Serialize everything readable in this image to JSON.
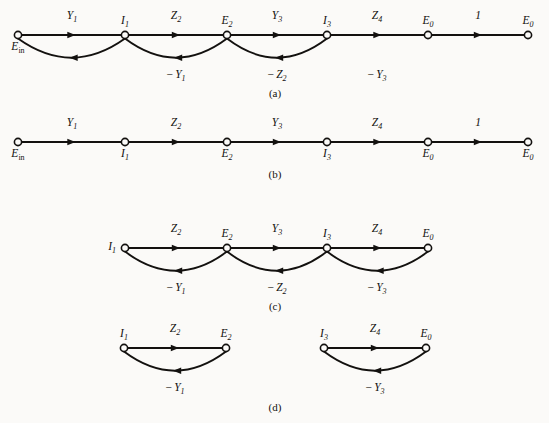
{
  "figure": {
    "width": 549,
    "height": 423,
    "ink_color": "#13110f",
    "paper_color": "#fbfaf8"
  },
  "panels": [
    {
      "id": "panel-a",
      "caption": "(a)",
      "caption_x": 275,
      "caption_y": 97,
      "baseline_y": 35,
      "nodes": [
        {
          "id": "n-a-ein",
          "label": "E",
          "sub": "in",
          "sub_style": "upright",
          "x": 18,
          "y": 35,
          "label_pos": "below"
        },
        {
          "id": "n-a-i1",
          "label": "I",
          "sub": "1",
          "sub_style": "italic",
          "x": 125,
          "y": 35,
          "label_pos": "above"
        },
        {
          "id": "n-a-e2",
          "label": "E",
          "sub": "2",
          "sub_style": "italic",
          "x": 227,
          "y": 35,
          "label_pos": "above"
        },
        {
          "id": "n-a-i3",
          "label": "I",
          "sub": "3",
          "sub_style": "italic",
          "x": 327,
          "y": 35,
          "label_pos": "above"
        },
        {
          "id": "n-a-e0",
          "label": "E",
          "sub": "0",
          "sub_style": "italic",
          "x": 428,
          "y": 35,
          "label_pos": "above"
        },
        {
          "id": "n-a-e0b",
          "label": "E",
          "sub": "0",
          "sub_style": "italic",
          "x": 528,
          "y": 35,
          "label_pos": "above"
        }
      ],
      "forward_edges": [
        {
          "id": "e-a-1",
          "from": 0,
          "to": 1,
          "label": "Y",
          "sub": "1",
          "sign": "",
          "label_x": 72,
          "label_y": 19
        },
        {
          "id": "e-a-2",
          "from": 1,
          "to": 2,
          "label": "Z",
          "sub": "2",
          "sign": "",
          "label_x": 176,
          "label_y": 19
        },
        {
          "id": "e-a-3",
          "from": 2,
          "to": 3,
          "label": "Y",
          "sub": "3",
          "sign": "",
          "label_x": 277,
          "label_y": 19
        },
        {
          "id": "e-a-4",
          "from": 3,
          "to": 4,
          "label": "Z",
          "sub": "4",
          "sign": "",
          "label_x": 377,
          "label_y": 19
        },
        {
          "id": "e-a-5",
          "from": 4,
          "to": 5,
          "label": "1",
          "sub": "",
          "sign": "",
          "label_x": 478,
          "label_y": 19
        }
      ],
      "feedback_edges": [
        {
          "id": "f-a-1",
          "from": 1,
          "to": 0,
          "label": "Y",
          "sub": "1",
          "sign": "−",
          "label_x": 176,
          "label_y": 78,
          "dip": 27
        },
        {
          "id": "f-a-2",
          "from": 2,
          "to": 1,
          "label": "Z",
          "sub": "2",
          "sign": "−",
          "label_x": 277,
          "label_y": 78,
          "dip": 27
        },
        {
          "id": "f-a-3",
          "from": 3,
          "to": 2,
          "label": "Y",
          "sub": "3",
          "sign": "−",
          "label_x": 377,
          "label_y": 78,
          "dip": 27
        }
      ]
    },
    {
      "id": "panel-b",
      "caption": "(b)",
      "caption_x": 275,
      "caption_y": 178,
      "baseline_y": 142,
      "nodes": [
        {
          "id": "n-b-ein",
          "label": "E",
          "sub": "in",
          "sub_style": "upright",
          "x": 18,
          "y": 142,
          "label_pos": "below"
        },
        {
          "id": "n-b-i1",
          "label": "I",
          "sub": "1",
          "sub_style": "italic",
          "x": 125,
          "y": 142,
          "label_pos": "below"
        },
        {
          "id": "n-b-e2",
          "label": "E",
          "sub": "2",
          "sub_style": "italic",
          "x": 227,
          "y": 142,
          "label_pos": "below"
        },
        {
          "id": "n-b-i3",
          "label": "I",
          "sub": "3",
          "sub_style": "italic",
          "x": 327,
          "y": 142,
          "label_pos": "below"
        },
        {
          "id": "n-b-e0",
          "label": "E",
          "sub": "0",
          "sub_style": "italic",
          "x": 428,
          "y": 142,
          "label_pos": "below"
        },
        {
          "id": "n-b-e0b",
          "label": "E",
          "sub": "0",
          "sub_style": "italic",
          "x": 528,
          "y": 142,
          "label_pos": "below"
        }
      ],
      "forward_edges": [
        {
          "id": "e-b-1",
          "from": 0,
          "to": 1,
          "label": "Y",
          "sub": "1",
          "sign": "",
          "label_x": 72,
          "label_y": 126
        },
        {
          "id": "e-b-2",
          "from": 1,
          "to": 2,
          "label": "Z",
          "sub": "2",
          "sign": "",
          "label_x": 176,
          "label_y": 126
        },
        {
          "id": "e-b-3",
          "from": 2,
          "to": 3,
          "label": "Y",
          "sub": "3",
          "sign": "",
          "label_x": 277,
          "label_y": 126
        },
        {
          "id": "e-b-4",
          "from": 3,
          "to": 4,
          "label": "Z",
          "sub": "4",
          "sign": "",
          "label_x": 377,
          "label_y": 126
        },
        {
          "id": "e-b-5",
          "from": 4,
          "to": 5,
          "label": "1",
          "sub": "",
          "sign": "",
          "label_x": 478,
          "label_y": 126
        }
      ],
      "feedback_edges": []
    },
    {
      "id": "panel-c",
      "caption": "(c)",
      "caption_x": 275,
      "caption_y": 310,
      "baseline_y": 248,
      "nodes": [
        {
          "id": "n-c-i1",
          "label": "I",
          "sub": "1",
          "sub_style": "italic",
          "x": 125,
          "y": 248,
          "label_pos": "left"
        },
        {
          "id": "n-c-e2",
          "label": "E",
          "sub": "2",
          "sub_style": "italic",
          "x": 227,
          "y": 248,
          "label_pos": "above"
        },
        {
          "id": "n-c-i3",
          "label": "I",
          "sub": "3",
          "sub_style": "italic",
          "x": 327,
          "y": 248,
          "label_pos": "above"
        },
        {
          "id": "n-c-e0",
          "label": "E",
          "sub": "0",
          "sub_style": "italic",
          "x": 428,
          "y": 248,
          "label_pos": "above"
        }
      ],
      "forward_edges": [
        {
          "id": "e-c-1",
          "from": 0,
          "to": 1,
          "label": "Z",
          "sub": "2",
          "sign": "",
          "label_x": 176,
          "label_y": 232
        },
        {
          "id": "e-c-2",
          "from": 1,
          "to": 2,
          "label": "Y",
          "sub": "3",
          "sign": "",
          "label_x": 277,
          "label_y": 232
        },
        {
          "id": "e-c-3",
          "from": 2,
          "to": 3,
          "label": "Z",
          "sub": "4",
          "sign": "",
          "label_x": 377,
          "label_y": 232
        }
      ],
      "feedback_edges": [
        {
          "id": "f-c-1",
          "from": 1,
          "to": 0,
          "label": "Y",
          "sub": "1",
          "sign": "−",
          "label_x": 176,
          "label_y": 291,
          "dip": 27
        },
        {
          "id": "f-c-2",
          "from": 2,
          "to": 1,
          "label": "Z",
          "sub": "2",
          "sign": "−",
          "label_x": 277,
          "label_y": 291,
          "dip": 27
        },
        {
          "id": "f-c-3",
          "from": 3,
          "to": 2,
          "label": "Y",
          "sub": "3",
          "sign": "−",
          "label_x": 377,
          "label_y": 291,
          "dip": 27
        }
      ]
    },
    {
      "id": "panel-d",
      "caption": "(d)",
      "caption_x": 275,
      "caption_y": 411,
      "baseline_y": 348,
      "nodes": [
        {
          "id": "n-d-i1",
          "label": "I",
          "sub": "1",
          "sub_style": "italic",
          "x": 124,
          "y": 348,
          "label_pos": "above"
        },
        {
          "id": "n-d-e2",
          "label": "E",
          "sub": "2",
          "sub_style": "italic",
          "x": 226,
          "y": 348,
          "label_pos": "above"
        },
        {
          "id": "n-d-i3",
          "label": "I",
          "sub": "3",
          "sub_style": "italic",
          "x": 324,
          "y": 348,
          "label_pos": "above"
        },
        {
          "id": "n-d-e0",
          "label": "E",
          "sub": "0",
          "sub_style": "italic",
          "x": 426,
          "y": 348,
          "label_pos": "above"
        }
      ],
      "forward_edges": [
        {
          "id": "e-d-1",
          "from": 0,
          "to": 1,
          "label": "Z",
          "sub": "2",
          "sign": "",
          "label_x": 175,
          "label_y": 332
        },
        {
          "id": "e-d-2",
          "from": 2,
          "to": 3,
          "label": "Z",
          "sub": "4",
          "sign": "",
          "label_x": 375,
          "label_y": 332
        }
      ],
      "feedback_edges": [
        {
          "id": "f-d-1",
          "from": 1,
          "to": 0,
          "label": "Y",
          "sub": "1",
          "sign": "−",
          "label_x": 175,
          "label_y": 391,
          "dip": 27
        },
        {
          "id": "f-d-2",
          "from": 3,
          "to": 2,
          "label": "Y",
          "sub": "3",
          "sign": "−",
          "label_x": 375,
          "label_y": 391,
          "dip": 27
        }
      ]
    }
  ]
}
